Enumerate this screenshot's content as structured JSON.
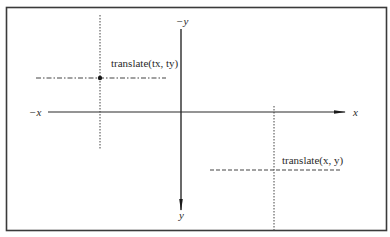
{
  "diagram": {
    "axes": {
      "x_negative_label": "−x",
      "x_positive_label": "x",
      "y_negative_label": "−y",
      "y_positive_label": "y"
    },
    "points": [
      {
        "id": "tx_ty",
        "label": "translate(tx, ty)",
        "horizontal_style": "dash-dot",
        "vertical_style": "dotted"
      },
      {
        "id": "x_y",
        "label": "translate(x, y)",
        "horizontal_style": "dashed",
        "vertical_style": "dotted"
      }
    ],
    "colors": {
      "frame": "#3a3a3a",
      "axis": "#2a2a2a",
      "guide": "#444444",
      "background": "#ffffff"
    }
  }
}
